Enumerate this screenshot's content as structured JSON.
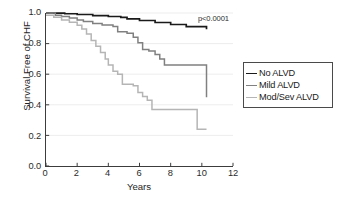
{
  "chart_data": {
    "type": "line",
    "subtype": "kaplan-meier-step",
    "title": "",
    "xlabel": "Years",
    "ylabel": "Survival Free of CHF",
    "xlim": [
      0,
      12
    ],
    "ylim": [
      0.0,
      1.0
    ],
    "xticks": [
      "0",
      "2",
      "4",
      "6",
      "8",
      "10",
      "12"
    ],
    "xtick_values": [
      0,
      2,
      4,
      6,
      8,
      10,
      12
    ],
    "yticks": [
      "0.0",
      "0.2",
      "0.4",
      "0.6",
      "0.8",
      "1.0"
    ],
    "ytick_values": [
      0.0,
      0.2,
      0.4,
      0.6,
      0.8,
      1.0
    ],
    "grid": "horizontal-faint",
    "legend_position": "right-outside",
    "annotations": [
      {
        "text": "p<0.0001",
        "x": 10.4,
        "y": 0.965
      }
    ],
    "series": [
      {
        "name": "No ALVD",
        "color": "#1a1a1a",
        "width": 1.7,
        "points": [
          [
            0.0,
            1.0
          ],
          [
            0.5,
            0.999
          ],
          [
            1.2,
            0.995
          ],
          [
            2.0,
            0.99
          ],
          [
            3.0,
            0.983
          ],
          [
            4.0,
            0.977
          ],
          [
            4.8,
            0.972
          ],
          [
            5.2,
            0.962
          ],
          [
            6.0,
            0.951
          ],
          [
            7.0,
            0.938
          ],
          [
            8.0,
            0.925
          ],
          [
            9.0,
            0.911
          ],
          [
            10.3,
            0.893
          ]
        ]
      },
      {
        "name": "Mild ALVD",
        "color": "#808080",
        "width": 1.5,
        "points": [
          [
            0.0,
            1.0
          ],
          [
            0.6,
            0.985
          ],
          [
            1.0,
            0.977
          ],
          [
            1.5,
            0.968
          ],
          [
            2.0,
            0.955
          ],
          [
            2.4,
            0.945
          ],
          [
            3.0,
            0.932
          ],
          [
            3.6,
            0.922
          ],
          [
            4.3,
            0.912
          ],
          [
            4.6,
            0.878
          ],
          [
            5.2,
            0.868
          ],
          [
            5.6,
            0.842
          ],
          [
            5.9,
            0.805
          ],
          [
            6.2,
            0.762
          ],
          [
            6.6,
            0.752
          ],
          [
            7.0,
            0.728
          ],
          [
            7.3,
            0.7
          ],
          [
            7.6,
            0.66
          ],
          [
            10.2,
            0.66
          ],
          [
            10.3,
            0.45
          ]
        ]
      },
      {
        "name": "Mod/Sev ALVD",
        "color": "#b5b5b5",
        "width": 1.5,
        "points": [
          [
            0.0,
            0.985
          ],
          [
            0.5,
            0.972
          ],
          [
            1.0,
            0.955
          ],
          [
            1.5,
            0.94
          ],
          [
            2.0,
            0.92
          ],
          [
            2.3,
            0.895
          ],
          [
            2.6,
            0.862
          ],
          [
            2.9,
            0.82
          ],
          [
            3.2,
            0.782
          ],
          [
            3.5,
            0.742
          ],
          [
            3.8,
            0.7
          ],
          [
            4.0,
            0.66
          ],
          [
            4.3,
            0.62
          ],
          [
            4.6,
            0.6
          ],
          [
            4.9,
            0.535
          ],
          [
            5.6,
            0.525
          ],
          [
            5.9,
            0.48
          ],
          [
            6.2,
            0.455
          ],
          [
            6.5,
            0.43
          ],
          [
            6.8,
            0.37
          ],
          [
            9.5,
            0.37
          ],
          [
            9.7,
            0.24
          ],
          [
            10.3,
            0.24
          ]
        ]
      }
    ]
  },
  "legend": {
    "entries": [
      {
        "label": "No ALVD",
        "color": "#1a1a1a"
      },
      {
        "label": "Mild ALVD",
        "color": "#808080"
      },
      {
        "label": "Mod/Sev ALVD",
        "color": "#b5b5b5"
      }
    ]
  }
}
